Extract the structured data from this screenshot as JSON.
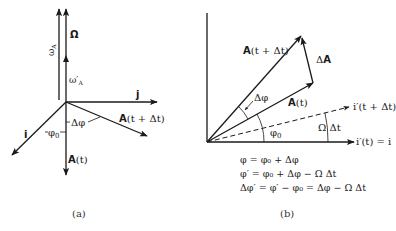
{
  "panel_a": {
    "caption": "(a)",
    "labels": {
      "omega_A": "ω",
      "omega_A_sub": "A",
      "Omega": "Ω",
      "omega_A_prime": "ω′",
      "omega_A_prime_sub": "A",
      "j": "j",
      "i": "i",
      "phi0": "φ",
      "phi0_sub": "0",
      "delta_phi": "Δφ",
      "A_t_bold": "A",
      "A_t_rest": "(t)",
      "A_t_dt_bold": "A",
      "A_t_dt_rest": "(t + Δt)"
    }
  },
  "panel_b": {
    "caption": "(b)",
    "labels": {
      "A_t_dt_bold": "A",
      "A_t_dt_rest": "(t + Δt)",
      "delta_A_pre": "Δ",
      "delta_A_bold": "A",
      "A_t_bold": "A",
      "A_t_rest": "(t)",
      "delta_phi": "Δφ",
      "phi0": "φ",
      "phi0_sub": "0",
      "i_prime_t_dt": "i′(t + Δt)",
      "omega_dt": "Ω Δt",
      "i_prime_t": "i′(t) = i"
    },
    "equations": [
      "φ = φ₀ + Δφ",
      "φ′ = φ₀ + Δφ − Ω Δt",
      "Δφ′ = φ′ − φ₀ = Δφ − Ω Δt"
    ]
  }
}
